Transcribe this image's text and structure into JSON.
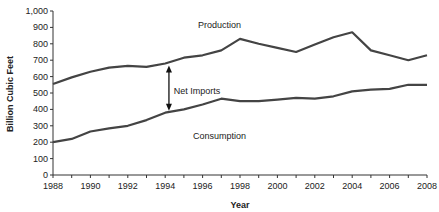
{
  "chart_data": {
    "type": "line",
    "title": "",
    "xlabel": "Year",
    "ylabel": "Billion Cubic Feet",
    "ylim": [
      0,
      1000
    ],
    "xlim": [
      1988,
      2008
    ],
    "yticks": [
      "0",
      "100",
      "200",
      "300",
      "400",
      "500",
      "600",
      "700",
      "800",
      "900",
      "1,000"
    ],
    "xticks": [
      "1988",
      "1990",
      "1992",
      "1994",
      "1996",
      "1998",
      "2000",
      "2002",
      "2004",
      "2006",
      "2008"
    ],
    "grid": false,
    "legend": "none",
    "x": [
      1988,
      1989,
      1990,
      1991,
      1992,
      1993,
      1994,
      1995,
      1996,
      1997,
      1998,
      1999,
      2000,
      2001,
      2002,
      2003,
      2004,
      2005,
      2006,
      2007,
      2008
    ],
    "series": [
      {
        "name": "Production",
        "values": [
          555,
          595,
          630,
          655,
          665,
          660,
          680,
          715,
          730,
          760,
          830,
          800,
          775,
          750,
          795,
          840,
          870,
          760,
          730,
          700,
          730
        ]
      },
      {
        "name": "Consumption",
        "values": [
          200,
          220,
          265,
          285,
          300,
          335,
          380,
          400,
          430,
          465,
          450,
          450,
          460,
          470,
          465,
          480,
          510,
          520,
          525,
          550,
          550
        ]
      }
    ],
    "annotations": [
      {
        "text": "Production",
        "x": 1996.9,
        "y": 915
      },
      {
        "text": "Net Imports",
        "x": 1995.7,
        "y": 515,
        "arrow": {
          "x": 1994.2,
          "from": 680,
          "to": 380,
          "double_headed": true
        }
      },
      {
        "text": "Consumption",
        "x": 1996.9,
        "y": 235
      }
    ],
    "line_color": "#444444"
  }
}
